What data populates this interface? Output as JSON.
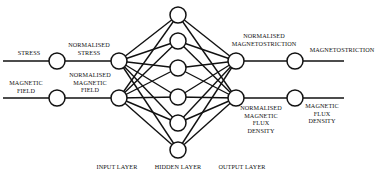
{
  "diagram": {
    "type": "neural-network",
    "inputs": [
      {
        "raw": "STRESS",
        "normalised": "NORMALISED\nSTRESS"
      },
      {
        "raw": "MAGNETIC\nFIELD",
        "normalised": "NORMALISED\nMAGNETIC\nFIELD"
      }
    ],
    "outputs": [
      {
        "normalised": "NORMALISED\nMAGNETOSTRICTION",
        "raw": "MAGNETOSTRICTION"
      },
      {
        "normalised": "NORMALISED\nMAGNETIC\nFLUX\nDENSITY",
        "raw": "MAGNETIC\nFLUX\nDENSITY"
      }
    ],
    "layers": {
      "input": "INPUT LAYER",
      "hidden": "HIDDEN LAYER",
      "output": "OUTPUT LAYER"
    },
    "node_counts": {
      "input": 2,
      "hidden": 6,
      "output": 2
    },
    "colors": {
      "stroke": "#111111",
      "background": "#ffffff"
    }
  }
}
